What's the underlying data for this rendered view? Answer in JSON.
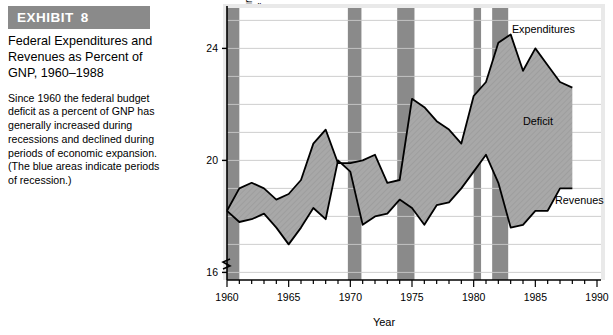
{
  "exhibit": {
    "banner_label": "EXHIBIT",
    "banner_number": "8",
    "banner_color": "#8a8a8a",
    "title": "Federal Expenditures and Revenues as Percent of GNP, 1960–1988",
    "body": "Since 1960 the federal budget deficit as a percent of GNP has generally increased during recessions and declined during periods of economic expansion. (The blue areas indicate periods of recession.)"
  },
  "chart_data": {
    "type": "area",
    "title": "",
    "xlabel": "Year",
    "ylabel": "Federal government expenditures and revenues\nas a percentage of GNP",
    "ylabel_line1": "Federal government expenditures and revenues",
    "ylabel_line2": "as a percentage of GNP",
    "xlim": [
      1960,
      1990
    ],
    "ylim": [
      15.2,
      25.2
    ],
    "y_ticks": [
      16,
      20,
      24
    ],
    "y_tick_labels": [
      "16",
      "20",
      "24"
    ],
    "y_gridlines": [
      16,
      17,
      18,
      19,
      20,
      21,
      22,
      23,
      24,
      25
    ],
    "x_ticks": [
      1960,
      1965,
      1970,
      1975,
      1980,
      1985,
      1990
    ],
    "x_tick_labels": [
      "1960",
      "1965",
      "1970",
      "1975",
      "1980",
      "1985",
      "1990"
    ],
    "x_minor_tick_step": 1,
    "axis_break": true,
    "grid": true,
    "legend_position": "inline-annotations",
    "annotations": [
      {
        "label": "Expenditures",
        "x": 1983.1,
        "y": 24.55
      },
      {
        "label": "Deficit",
        "x": 1984.0,
        "y": 21.25
      },
      {
        "label": "Revenues",
        "x": 1986.6,
        "y": 18.45
      }
    ],
    "fill_label": "Deficit",
    "fill_color": "#a8a8a8",
    "recession_color": "#8a8a8a",
    "x": [
      1960,
      1961,
      1962,
      1963,
      1964,
      1965,
      1966,
      1967,
      1968,
      1969,
      1970,
      1971,
      1972,
      1973,
      1974,
      1975,
      1976,
      1977,
      1978,
      1979,
      1980,
      1981,
      1982,
      1983,
      1984,
      1985,
      1986,
      1987,
      1988
    ],
    "series": [
      {
        "name": "Expenditures",
        "values": [
          18.2,
          19.0,
          19.2,
          19.0,
          18.6,
          18.8,
          19.3,
          20.6,
          21.1,
          19.9,
          19.9,
          20.0,
          20.2,
          19.2,
          19.3,
          22.2,
          21.9,
          21.4,
          21.1,
          20.6,
          22.3,
          22.8,
          24.2,
          24.5,
          23.2,
          24.0,
          23.4,
          22.8,
          22.6
        ]
      },
      {
        "name": "Revenues",
        "values": [
          18.2,
          17.8,
          17.9,
          18.1,
          17.6,
          17.0,
          17.6,
          18.3,
          17.9,
          20.0,
          19.6,
          17.7,
          18.0,
          18.1,
          18.6,
          18.3,
          17.7,
          18.4,
          18.5,
          19.0,
          19.6,
          20.2,
          19.2,
          17.6,
          17.7,
          18.2,
          18.2,
          19.0,
          19.0
        ]
      }
    ],
    "recession_bands": [
      {
        "start": 1960.0,
        "end": 1961.0
      },
      {
        "start": 1969.8,
        "end": 1970.9
      },
      {
        "start": 1973.8,
        "end": 1975.2
      },
      {
        "start": 1980.0,
        "end": 1980.6
      },
      {
        "start": 1981.5,
        "end": 1982.8
      }
    ]
  }
}
